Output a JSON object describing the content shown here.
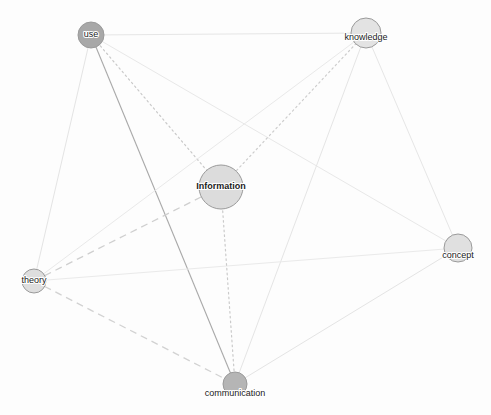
{
  "graph": {
    "title": "information concept network graph",
    "background_color": "#fdfdfd",
    "canvas": {
      "width": 491,
      "height": 415
    },
    "nodes": [
      {
        "id": "use",
        "label": "use",
        "x": 91,
        "y": 35,
        "r": 13,
        "fill": "#a8a8a8",
        "stroke": "#8f8f8f",
        "font_size": 9,
        "font_weight": "normal",
        "label_dy": 0
      },
      {
        "id": "knowledge",
        "label": "knowledge",
        "x": 366,
        "y": 33,
        "r": 15,
        "fill": "#e3e3e3",
        "stroke": "#b9b9b9",
        "font_size": 9,
        "font_weight": "normal",
        "label_dy": 5
      },
      {
        "id": "Information",
        "label": "Information",
        "x": 221,
        "y": 187,
        "r": 22,
        "fill": "#dcdcdc",
        "stroke": "#b0b0b0",
        "font_size": 9,
        "font_weight": "bold",
        "label_dy": 0
      },
      {
        "id": "concept",
        "label": "concept",
        "x": 458,
        "y": 248,
        "r": 14,
        "fill": "#e0e0e0",
        "stroke": "#b6b6b6",
        "font_size": 9,
        "font_weight": "normal",
        "label_dy": 8
      },
      {
        "id": "theory",
        "label": "theory",
        "x": 34,
        "y": 281,
        "r": 12,
        "fill": "#dedede",
        "stroke": "#b4b4b4",
        "font_size": 9,
        "font_weight": "normal",
        "label_dy": 0
      },
      {
        "id": "communication",
        "label": "communication",
        "x": 235,
        "y": 384,
        "r": 12,
        "fill": "#b5b5b5",
        "stroke": "#9c9c9c",
        "font_size": 9,
        "font_weight": "normal",
        "label_dy": 10
      }
    ],
    "edges": [
      {
        "source": "use",
        "target": "knowledge",
        "style": "solid",
        "color": "#e6e6e6",
        "width": 1.0
      },
      {
        "source": "use",
        "target": "concept",
        "style": "solid",
        "color": "#e8e8e8",
        "width": 1.0
      },
      {
        "source": "use",
        "target": "theory",
        "style": "solid",
        "color": "#e4e4e4",
        "width": 1.0
      },
      {
        "source": "use",
        "target": "communication",
        "style": "solid",
        "color": "#a9a9a9",
        "width": 1.1
      },
      {
        "source": "use",
        "target": "Information",
        "style": "dotted",
        "color": "#c9c9c9",
        "width": 1.2
      },
      {
        "source": "knowledge",
        "target": "concept",
        "style": "solid",
        "color": "#e6e6e6",
        "width": 1.0
      },
      {
        "source": "knowledge",
        "target": "theory",
        "style": "solid",
        "color": "#e9e9e9",
        "width": 1.0
      },
      {
        "source": "knowledge",
        "target": "communication",
        "style": "solid",
        "color": "#e5e5e5",
        "width": 1.0
      },
      {
        "source": "knowledge",
        "target": "Information",
        "style": "dotted",
        "color": "#cdcdcd",
        "width": 1.2
      },
      {
        "source": "theory",
        "target": "concept",
        "style": "solid",
        "color": "#eaeaea",
        "width": 1.0
      },
      {
        "source": "theory",
        "target": "Information",
        "style": "dashed",
        "color": "#cfcfcf",
        "width": 1.3
      },
      {
        "source": "theory",
        "target": "communication",
        "style": "dashed",
        "color": "#d2d2d2",
        "width": 1.3
      },
      {
        "source": "concept",
        "target": "communication",
        "style": "solid",
        "color": "#e4e4e4",
        "width": 1.0
      },
      {
        "source": "Information",
        "target": "communication",
        "style": "dotted",
        "color": "#cacaca",
        "width": 1.2
      }
    ],
    "edge_style_dasharrays": {
      "solid": "none",
      "dashed": "7 5",
      "dotted": "1.6 3.2"
    }
  }
}
